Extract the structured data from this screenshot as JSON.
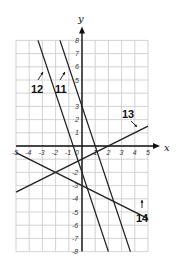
{
  "chart_data": {
    "type": "line",
    "title": "",
    "xlabel": "x",
    "ylabel": "y",
    "xlim": [
      -5,
      5
    ],
    "ylim": [
      -8,
      8
    ],
    "grid": true,
    "x_ticks": [
      "-5",
      "-4",
      "-3",
      "-2",
      "-1",
      "1",
      "2",
      "3",
      "4",
      "5"
    ],
    "y_ticks": [
      "8",
      "7",
      "6",
      "5",
      "3",
      "2",
      "1",
      "-2",
      "-3",
      "-4",
      "-5",
      "-6",
      "-7",
      "-8"
    ],
    "origin_label": "0",
    "series": [
      {
        "name": "11",
        "equation": "y = -3x + 3",
        "x": [
          -1.667,
          3.667
        ],
        "y": [
          8,
          -8
        ]
      },
      {
        "name": "12",
        "equation": "y = -3x - 2",
        "x": [
          -3.333,
          2
        ],
        "y": [
          8,
          -8
        ]
      },
      {
        "name": "13",
        "equation": "y = 0.5x - 1",
        "x": [
          -5,
          5
        ],
        "y": [
          -3.5,
          1.5
        ]
      },
      {
        "name": "14",
        "equation": "y = -0.5x - 3",
        "x": [
          -5,
          5
        ],
        "y": [
          -0.5,
          -5.5
        ]
      }
    ],
    "annotations": [
      {
        "text": "12",
        "points_to": "line 12"
      },
      {
        "text": "11",
        "points_to": "line 11"
      },
      {
        "text": "13",
        "points_to": "line 13"
      },
      {
        "text": "14",
        "points_to": "line 14"
      }
    ]
  },
  "labels": {
    "x_axis": "x",
    "y_axis": "y",
    "line11": "11",
    "line12": "12",
    "line13": "13",
    "line14": "14"
  }
}
